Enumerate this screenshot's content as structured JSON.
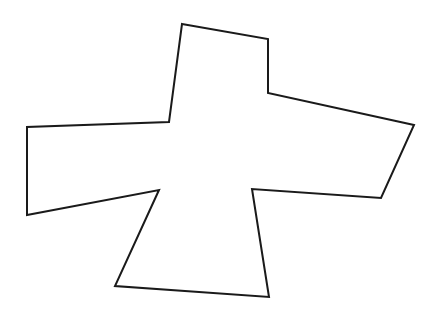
{
  "diagram": {
    "shape": "polygon",
    "stroke": "#1a1a1a",
    "fill": "#ffffff",
    "stroke_width": 2,
    "points": "182,24 268,39 268,93 414,125 381,198 252,189 269,297 115,286 159,190 27,215 27,127 169,122"
  }
}
